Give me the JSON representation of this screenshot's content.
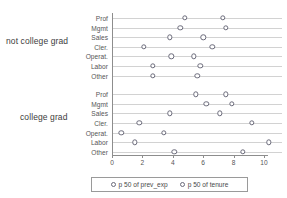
{
  "chart_data": {
    "type": "scatter",
    "title": "",
    "xlabel": "",
    "ylabel": "",
    "xlim": [
      0,
      10.6
    ],
    "grid": "horizontal-row-lines",
    "legend_position": "bottom",
    "xticks": [
      0,
      2,
      4,
      6,
      8,
      10
    ],
    "xtick_labels": [
      "0",
      "2",
      "4",
      "6",
      "8",
      "10"
    ],
    "groups": [
      {
        "label": "not college grad",
        "categories": [
          "Prof",
          "Mgmt",
          "Sales",
          "Cler.",
          "Operat.",
          "Labor",
          "Other"
        ],
        "series": [
          {
            "name": "p 50 of prev_exp",
            "values": [
              4.8,
              4.5,
              3.8,
              2.1,
              3.9,
              2.7,
              2.7
            ]
          },
          {
            "name": "p 50 of tenure",
            "values": [
              7.3,
              7.5,
              6.0,
              6.6,
              5.4,
              5.8,
              5.6
            ]
          }
        ]
      },
      {
        "label": "college grad",
        "categories": [
          "Prof",
          "Mgmt",
          "Sales",
          "Cler.",
          "Operat.",
          "Labor",
          "Other"
        ],
        "series": [
          {
            "name": "p 50 of prev_exp",
            "values": [
              5.5,
              6.2,
              3.8,
              1.8,
              0.6,
              1.5,
              4.1
            ]
          },
          {
            "name": "p 50 of tenure",
            "values": [
              7.5,
              7.9,
              7.1,
              9.2,
              3.4,
              10.3,
              8.6
            ]
          }
        ]
      }
    ],
    "legend": [
      {
        "label": "p 50 of prev_exp",
        "marker": "open-circle",
        "color": "#6a6a7a"
      },
      {
        "label": "p 50 of tenure",
        "marker": "open-circle",
        "color": "#6a6a7a"
      }
    ],
    "colors": {
      "marker_stroke": "#6a6a7a",
      "marker_fill": "#ffffff",
      "row_line": "#d2d2d2",
      "axis": "#8d8d8d",
      "text": "#4a4a4a",
      "background": "#ffffff"
    }
  }
}
